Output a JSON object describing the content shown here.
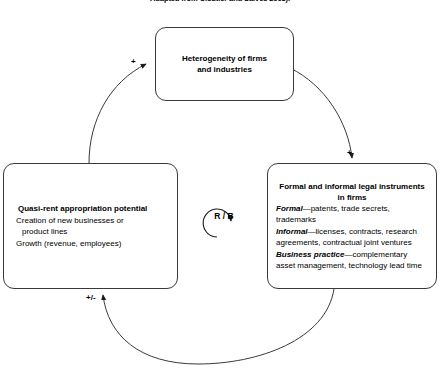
{
  "figure": {
    "caption": "Adapted from Cloutier and Salves 2003).",
    "loop_label": "R / B"
  },
  "nodes": {
    "top": {
      "line1": "Heterogeneity of firms",
      "line2": "and industries"
    },
    "left": {
      "title": "Quasi-rent appropriation potential",
      "line1": "Creation of new businesses or",
      "line2": "product lines",
      "line3": "Growth (revenue, employees)"
    },
    "right": {
      "title_line1": "Formal and informal legal instruments",
      "title_line2": "in firms",
      "formal_label": "Formal",
      "formal_text": "—patents, trade secrets,",
      "formal_text2": "trademarks",
      "informal_label": "Informal",
      "informal_text": "—licenses, contracts, research",
      "informal_text2": "agreements, contractual joint ventures",
      "practice_label": "Business practice",
      "practice_text": "—complementary",
      "practice_text2": "asset management, technology lead time"
    }
  },
  "links": [
    {
      "id": "left-to-top",
      "from": "Quasi-rent appropriation potential",
      "to": "Heterogeneity of firms and industries",
      "polarity": "+"
    },
    {
      "id": "top-to-right",
      "from": "Heterogeneity of firms and industries",
      "to": "Formal and informal legal instruments in firms",
      "polarity": "+"
    },
    {
      "id": "right-to-left",
      "from": "Formal and informal legal instruments in firms",
      "to": "Quasi-rent appropriation potential",
      "polarity": "+/-"
    }
  ],
  "colors": {
    "stroke": "#3a3a3a",
    "text": "#000000",
    "background": "#ffffff"
  }
}
